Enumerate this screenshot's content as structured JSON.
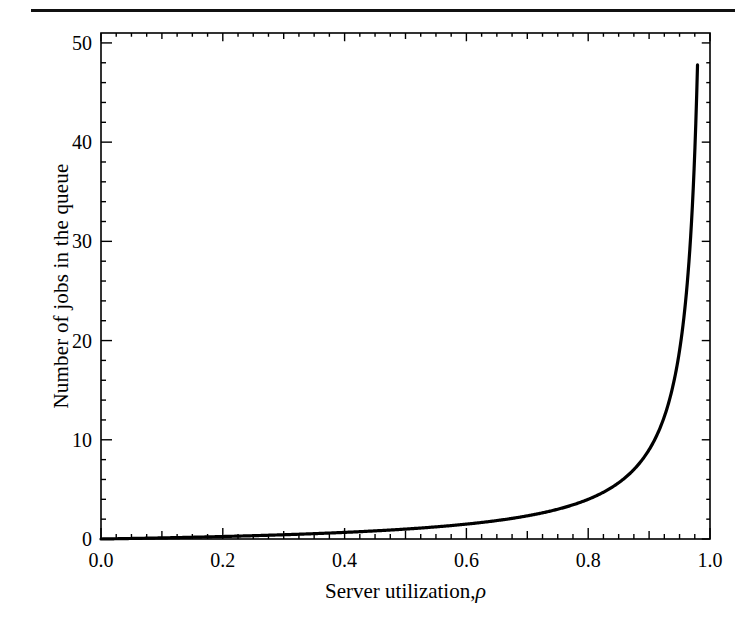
{
  "figure": {
    "background_color": "#ffffff",
    "ink_color": "#000000",
    "rule_color": "#111111"
  },
  "chart_data": {
    "type": "line",
    "title": "",
    "xlabel_text": "Server utilization,",
    "xlabel_symbol": "ρ",
    "ylabel": "Number of jobs in the queue",
    "xlim": [
      0.0,
      1.0
    ],
    "ylim": [
      0,
      51
    ],
    "grid": false,
    "legend": false,
    "x_ticks": [
      0.0,
      0.2,
      0.4,
      0.6,
      0.8,
      1.0
    ],
    "x_tick_labels": [
      "0.0",
      "0.2",
      "0.4",
      "0.6",
      "0.8",
      "1.0"
    ],
    "x_minor_tick_step": 0.025,
    "x_medium_tick_step": 0.1,
    "y_ticks": [
      0,
      10,
      20,
      30,
      40,
      50
    ],
    "y_tick_labels": [
      "0",
      "10",
      "20",
      "30",
      "40",
      "50"
    ],
    "y_minor_tick_step": 2,
    "y_medium_tick_step": 10,
    "series": [
      {
        "name": "M/M/1 mean number in queue",
        "formula": "rho / (1 - rho)",
        "line_color": "#000000",
        "line_width": 3.2,
        "x": [
          0.0,
          0.05,
          0.1,
          0.15,
          0.2,
          0.25,
          0.3,
          0.35,
          0.4,
          0.45,
          0.5,
          0.55,
          0.6,
          0.65,
          0.7,
          0.75,
          0.8,
          0.82,
          0.84,
          0.86,
          0.88,
          0.9,
          0.91,
          0.92,
          0.93,
          0.94,
          0.95,
          0.955,
          0.96,
          0.965,
          0.97,
          0.975,
          0.9795
        ],
        "y": [
          0.0,
          0.05,
          0.11,
          0.18,
          0.25,
          0.33,
          0.43,
          0.54,
          0.67,
          0.82,
          1.0,
          1.22,
          1.5,
          1.86,
          2.33,
          3.0,
          4.0,
          4.56,
          5.25,
          6.14,
          7.33,
          9.0,
          10.11,
          11.5,
          13.29,
          15.67,
          19.0,
          21.22,
          24.0,
          27.57,
          32.33,
          39.0,
          47.8
        ]
      }
    ]
  }
}
